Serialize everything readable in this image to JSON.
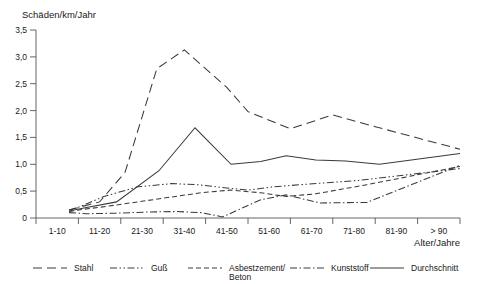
{
  "chart_data": {
    "type": "line",
    "title": "",
    "ylabel": "Schäden/km/Jahr",
    "xlabel": "Alter/Jahre",
    "categories": [
      "1-10",
      "11-20",
      "21-30",
      "31-40",
      "41-50",
      "51-60",
      "61-70",
      "71-80",
      "81-90",
      "> 90"
    ],
    "ylim": [
      0,
      3.5
    ],
    "xlim": [
      0,
      10
    ],
    "ytick_labels": [
      "0",
      "0,5",
      "1,0",
      "1,5",
      "2,0",
      "2,5",
      "3,0",
      "3,5"
    ],
    "ytick_values": [
      0,
      0.5,
      1.0,
      1.5,
      2.0,
      2.5,
      3.0,
      3.5
    ],
    "grid": false,
    "legend_position": "bottom",
    "series": [
      {
        "name": "Stahl",
        "dash": "9,5",
        "values": [
          null,
          0.15,
          0.3,
          0.85,
          2.78,
          3.13,
          2.43,
          1.98,
          1.66,
          1.92,
          1.7,
          1.28
        ],
        "x": [
          0.0,
          0.78,
          1.5,
          2.1,
          2.85,
          3.5,
          4.5,
          5.0,
          6.0,
          7.0,
          8.0,
          10.0
        ]
      },
      {
        "name": "Guß",
        "dash": "7,2.5,1.5,2.5,1.5,2.5",
        "values": [
          0.15,
          0.2,
          0.4,
          0.58,
          0.64,
          0.62,
          0.56,
          0.52,
          0.58,
          0.63,
          0.7,
          0.92
        ],
        "x": [
          0.78,
          1.0,
          1.6,
          2.4,
          3.2,
          3.8,
          4.5,
          5.0,
          5.6,
          6.4,
          7.6,
          10.0
        ]
      },
      {
        "name": "Asbestzement/\nBeton",
        "dash": "5,3",
        "values": [
          0.12,
          0.16,
          0.22,
          0.3,
          0.38,
          0.47,
          0.52,
          0.47,
          0.4,
          0.45,
          0.62,
          0.96
        ],
        "x": [
          0.78,
          1.1,
          1.7,
          2.4,
          3.1,
          3.9,
          4.6,
          5.3,
          5.9,
          6.6,
          7.8,
          10.0
        ]
      },
      {
        "name": "Kunststoff",
        "dash": "7,2.5,1.5,2.5",
        "values": [
          0.1,
          0.08,
          0.09,
          0.11,
          0.12,
          0.1,
          0.02,
          0.34,
          0.43,
          0.28,
          0.29,
          0.98
        ],
        "x": [
          0.78,
          1.2,
          1.9,
          2.6,
          3.3,
          3.9,
          4.4,
          5.3,
          5.9,
          6.7,
          7.8,
          10.0
        ]
      },
      {
        "name": "Durchschnitt",
        "dash": "",
        "values": [
          0.13,
          0.18,
          0.3,
          0.88,
          1.68,
          1.0,
          1.05,
          1.16,
          1.08,
          1.06,
          1.0,
          1.2
        ],
        "x": [
          0.78,
          1.1,
          1.9,
          2.9,
          3.75,
          4.6,
          5.3,
          5.9,
          6.6,
          7.3,
          8.1,
          10.0
        ]
      }
    ],
    "legend": [
      {
        "label": "Stahl",
        "dash": "9,5"
      },
      {
        "label": "Guß",
        "dash": "7,2.5,1.5,2.5,1.5,2.5"
      },
      {
        "label": "Asbestzement/",
        "label2": "Beton",
        "dash": "5,3"
      },
      {
        "label": "Kunststoff",
        "dash": "7,2.5,1.5,2.5"
      },
      {
        "label": "Durchschnitt",
        "dash": ""
      }
    ],
    "line_color": "#3a3a3a",
    "axis_color": "#555555"
  }
}
